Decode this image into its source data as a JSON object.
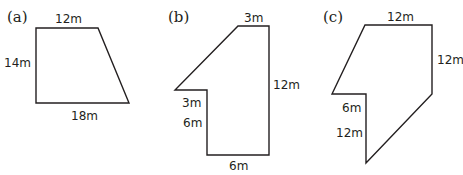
{
  "figure": {
    "shapes": [
      {
        "id": "a",
        "tag": "(a)",
        "kind": "trapezoid",
        "points": "36,28 98,28 129,103 36,103",
        "labels": {
          "top": "12m",
          "left": "14m",
          "bottom": "18m"
        }
      },
      {
        "id": "b",
        "tag": "(b)",
        "kind": "composite-polygon",
        "points": "238,26 269,26 269,155 207,155 207,90 175,90",
        "labels": {
          "top": "3m",
          "right": "12m",
          "bottom": "6m",
          "left_upper": "3m",
          "left_lower": "6m"
        }
      },
      {
        "id": "c",
        "tag": "(c)",
        "kind": "composite-polygon",
        "points": "365,25 432,25 432,94 366,163 366,94 332,94",
        "labels": {
          "top": "12m",
          "right": "12m",
          "left_upper": "6m",
          "left_lower": "12m"
        }
      }
    ],
    "stroke_color": "#231f20"
  }
}
